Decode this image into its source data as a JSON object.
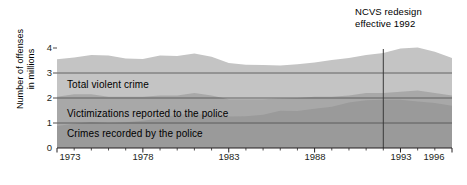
{
  "chart_data": {
    "type": "area",
    "stacked": true,
    "title": "",
    "xlabel": "",
    "ylabel": "Number of offenses\nin millions",
    "ylim": [
      0,
      4
    ],
    "yticks": [
      "0",
      "1",
      "2",
      "3",
      "4"
    ],
    "xlim": [
      1973,
      1996
    ],
    "grid": "horizontal gridlines at y = 1, 2, 3",
    "legend_position": "inline labels inside bands",
    "x": [
      1973,
      1974,
      1975,
      1976,
      1977,
      1978,
      1979,
      1980,
      1981,
      1982,
      1983,
      1984,
      1985,
      1986,
      1987,
      1988,
      1989,
      1990,
      1991,
      1992,
      1993,
      1994,
      1995,
      1996
    ],
    "xtick_labels": [
      {
        "year": 1973,
        "label": "1973"
      },
      {
        "year": 1978,
        "label": "1978"
      },
      {
        "year": 1983,
        "label": "1983"
      },
      {
        "year": 1988,
        "label": "1988"
      },
      {
        "year": 1993,
        "label": "1993"
      },
      {
        "year": 1996,
        "label": "1996"
      }
    ],
    "series": [
      {
        "name": "Crimes recorded by the police",
        "color": "#9a9a9a",
        "values": [
          0.88,
          0.97,
          1.04,
          1.0,
          1.03,
          1.09,
          1.18,
          1.34,
          1.36,
          1.32,
          1.26,
          1.27,
          1.33,
          1.49,
          1.48,
          1.57,
          1.65,
          1.82,
          1.91,
          1.93,
          1.93,
          1.86,
          1.8,
          1.69
        ]
      },
      {
        "name": "Victimizations reported to the police",
        "color": "#a8a8a8",
        "cumulative_top": [
          2.05,
          2.15,
          2.15,
          2.05,
          2.05,
          2.05,
          2.1,
          2.1,
          2.2,
          2.1,
          1.95,
          1.95,
          1.95,
          1.98,
          2.0,
          2.05,
          2.05,
          2.1,
          2.2,
          2.2,
          2.25,
          2.3,
          2.2,
          2.1
        ]
      },
      {
        "name": "Total violent crime",
        "color": "#c4c4c4",
        "cumulative_top": [
          3.55,
          3.62,
          3.72,
          3.7,
          3.58,
          3.56,
          3.7,
          3.68,
          3.78,
          3.65,
          3.4,
          3.33,
          3.32,
          3.3,
          3.35,
          3.42,
          3.52,
          3.6,
          3.72,
          3.8,
          3.98,
          4.02,
          3.85,
          3.6
        ]
      }
    ],
    "annotations": [
      {
        "name": "ncvs-redesign",
        "text": "NCVS redesign\neffective 1992",
        "year": 1992,
        "line": true
      }
    ]
  },
  "axis": {
    "y_title": "Number of offenses\nin millions",
    "y_ticks": [
      "4",
      "3",
      "2",
      "1",
      "0"
    ],
    "x_ticks": [
      "1973",
      "1978",
      "1983",
      "1988",
      "1993",
      "1996"
    ]
  },
  "labels": {
    "total_violent_crime": "Total violent crime",
    "victimizations_reported": "Victimizations reported to the police",
    "crimes_recorded": "Crimes recorded by the police"
  },
  "annotation": {
    "text": "NCVS redesign\neffective 1992"
  },
  "colors": {
    "band_top": "#c4c4c4",
    "band_middle": "#a8a8a8",
    "band_bottom": "#9a9a9a",
    "gridline": "#4d4d4d",
    "axis": "#231f20",
    "text": "#000000"
  }
}
